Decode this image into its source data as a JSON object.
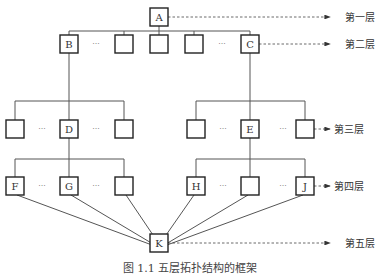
{
  "diagram": {
    "type": "hierarchy",
    "layer_labels": [
      "第一层",
      "第二层",
      "第三层",
      "第四层",
      "第五层"
    ],
    "ellipsis": "···",
    "nodes": [
      {
        "id": "A",
        "label": "A",
        "layer": 1,
        "x": 159,
        "y": 17
      },
      {
        "id": "B",
        "label": "B",
        "layer": 2,
        "x": 69,
        "y": 44
      },
      {
        "id": "L2a",
        "label": "",
        "layer": 2,
        "x": 124,
        "y": 44
      },
      {
        "id": "L2b",
        "label": "",
        "layer": 2,
        "x": 159,
        "y": 44
      },
      {
        "id": "L2c",
        "label": "",
        "layer": 2,
        "x": 194,
        "y": 44
      },
      {
        "id": "C",
        "label": "C",
        "layer": 2,
        "x": 250,
        "y": 44
      },
      {
        "id": "L3a",
        "label": "",
        "layer": 3,
        "x": 15,
        "y": 129
      },
      {
        "id": "D",
        "label": "D",
        "layer": 3,
        "x": 69,
        "y": 129
      },
      {
        "id": "L3b",
        "label": "",
        "layer": 3,
        "x": 124,
        "y": 129
      },
      {
        "id": "L3c",
        "label": "",
        "layer": 3,
        "x": 196,
        "y": 129
      },
      {
        "id": "E",
        "label": "E",
        "layer": 3,
        "x": 250,
        "y": 129
      },
      {
        "id": "L3d",
        "label": "",
        "layer": 3,
        "x": 305,
        "y": 129
      },
      {
        "id": "F",
        "label": "F",
        "layer": 4,
        "x": 15,
        "y": 186
      },
      {
        "id": "G",
        "label": "G",
        "layer": 4,
        "x": 69,
        "y": 186
      },
      {
        "id": "L4a",
        "label": "",
        "layer": 4,
        "x": 124,
        "y": 186
      },
      {
        "id": "H",
        "label": "H",
        "layer": 4,
        "x": 196,
        "y": 186
      },
      {
        "id": "L4b",
        "label": "",
        "layer": 4,
        "x": 250,
        "y": 186
      },
      {
        "id": "J",
        "label": "J",
        "layer": 4,
        "x": 305,
        "y": 186
      },
      {
        "id": "K",
        "label": "K",
        "layer": 5,
        "x": 159,
        "y": 243
      }
    ],
    "ellipses_positions": [
      {
        "x": 96,
        "y": 44
      },
      {
        "x": 222,
        "y": 44
      },
      {
        "x": 42,
        "y": 129
      },
      {
        "x": 96,
        "y": 129
      },
      {
        "x": 223,
        "y": 129
      },
      {
        "x": 283,
        "y": 129
      },
      {
        "x": 42,
        "y": 186
      },
      {
        "x": 96,
        "y": 186
      },
      {
        "x": 223,
        "y": 186
      },
      {
        "x": 283,
        "y": 186
      }
    ],
    "tree_edges": [
      [
        "A",
        "B"
      ],
      [
        "A",
        "L2a"
      ],
      [
        "A",
        "L2b"
      ],
      [
        "A",
        "L2c"
      ],
      [
        "A",
        "C"
      ],
      [
        "B",
        "D"
      ],
      [
        "D",
        "L3a"
      ],
      [
        "D",
        "L3b"
      ],
      [
        "C",
        "E"
      ],
      [
        "E",
        "L3c"
      ],
      [
        "E",
        "L3d"
      ],
      [
        "D",
        "F"
      ],
      [
        "D",
        "G"
      ],
      [
        "D",
        "L4a"
      ],
      [
        "E",
        "H"
      ],
      [
        "E",
        "L4b"
      ],
      [
        "E",
        "J"
      ]
    ],
    "converge_edges": [
      [
        "F",
        "K"
      ],
      [
        "G",
        "K"
      ],
      [
        "L4a",
        "K"
      ],
      [
        "H",
        "K"
      ],
      [
        "L4b",
        "K"
      ],
      [
        "J",
        "K"
      ]
    ]
  },
  "caption": "图 1.1   五层拓扑结构的框架"
}
